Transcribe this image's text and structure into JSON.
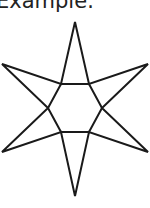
{
  "caption": {
    "text": "Example:"
  },
  "figure": {
    "shape": "six-pointed-star",
    "stroke_color": "#1a1a1a",
    "stroke_width": 2,
    "fill_color": "#ffffff",
    "outer_points": [
      [
        75,
        22
      ],
      [
        148,
        64
      ],
      [
        148,
        152
      ],
      [
        75,
        196
      ],
      [
        2,
        152
      ],
      [
        2,
        64
      ]
    ],
    "inner_hexagon": [
      [
        61,
        84
      ],
      [
        89,
        84
      ],
      [
        102,
        108
      ],
      [
        89,
        132
      ],
      [
        61,
        132
      ],
      [
        48,
        108
      ]
    ]
  }
}
